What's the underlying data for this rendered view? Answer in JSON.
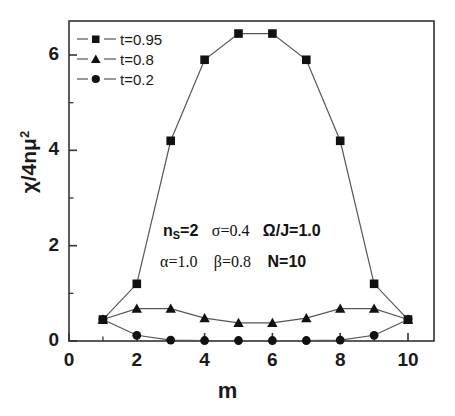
{
  "chart_data": {
    "type": "line",
    "title": "",
    "xlabel": "m",
    "ylabel": "χ/4nμ²",
    "xlim": [
      0,
      11
    ],
    "ylim": [
      0,
      6.9
    ],
    "xticks": [
      0,
      2,
      4,
      6,
      8,
      10
    ],
    "xtick_labels": [
      "0",
      "2",
      "4",
      "6",
      "8",
      "10"
    ],
    "yticks": [
      0,
      2,
      4,
      6
    ],
    "ytick_labels": [
      "0",
      "2",
      "4",
      "6"
    ],
    "minor_yticks": [
      1,
      3,
      5
    ],
    "minor_xticks": [
      1,
      3,
      5,
      7,
      9
    ],
    "grid": false,
    "legend_position": "upper-left",
    "x": [
      1,
      2,
      3,
      4,
      5,
      6,
      7,
      8,
      9,
      10
    ],
    "series": [
      {
        "name": "t=0.95",
        "marker": "square",
        "color": "#000000",
        "values": [
          0.45,
          1.2,
          4.2,
          5.9,
          6.45,
          6.45,
          5.9,
          4.2,
          1.2,
          0.45
        ]
      },
      {
        "name": "t=0.8",
        "marker": "triangle",
        "color": "#000000",
        "values": [
          0.45,
          0.68,
          0.68,
          0.48,
          0.38,
          0.38,
          0.48,
          0.68,
          0.68,
          0.45
        ]
      },
      {
        "name": "t=0.2",
        "marker": "circle",
        "color": "#000000",
        "values": [
          0.45,
          0.12,
          0.02,
          0.01,
          0.01,
          0.01,
          0.01,
          0.02,
          0.12,
          0.45
        ]
      }
    ],
    "annotations": [
      {
        "id": "params-line-1",
        "text": "n_S=2  σ=0.4  Ω/J=1.0",
        "x": 5.0,
        "y": 2.5
      },
      {
        "id": "params-line-2",
        "text": "α=1.0  β=0.8  N=10",
        "x": 5.0,
        "y": 1.85
      }
    ]
  },
  "legend": {
    "entries": [
      {
        "label": "t=0.95",
        "marker": "square"
      },
      {
        "label": "t=0.8",
        "marker": "triangle"
      },
      {
        "label": "t=0.2",
        "marker": "circle"
      }
    ]
  },
  "axes": {
    "x_label": "m",
    "y_label_parts": {
      "chi": "χ",
      "slash": "/4n",
      "mu": "μ",
      "exp": "2"
    },
    "x_tick_labels": [
      "0",
      "2",
      "4",
      "6",
      "8",
      "10"
    ],
    "y_tick_labels": [
      "0",
      "2",
      "4",
      "6"
    ]
  },
  "annotations": {
    "line1": {
      "ns": "n",
      "ns_sub": "S",
      "ns_val": "=2",
      "sigma": "σ=0.4",
      "omega": "Ω/J=1.0"
    },
    "line2": {
      "alpha": "α=1.0",
      "beta": "β=0.8",
      "n": "N=10"
    }
  },
  "style": {
    "axis_color": "#333333",
    "line_color": "#555555",
    "marker_color": "#111111",
    "background": "#ffffff"
  }
}
